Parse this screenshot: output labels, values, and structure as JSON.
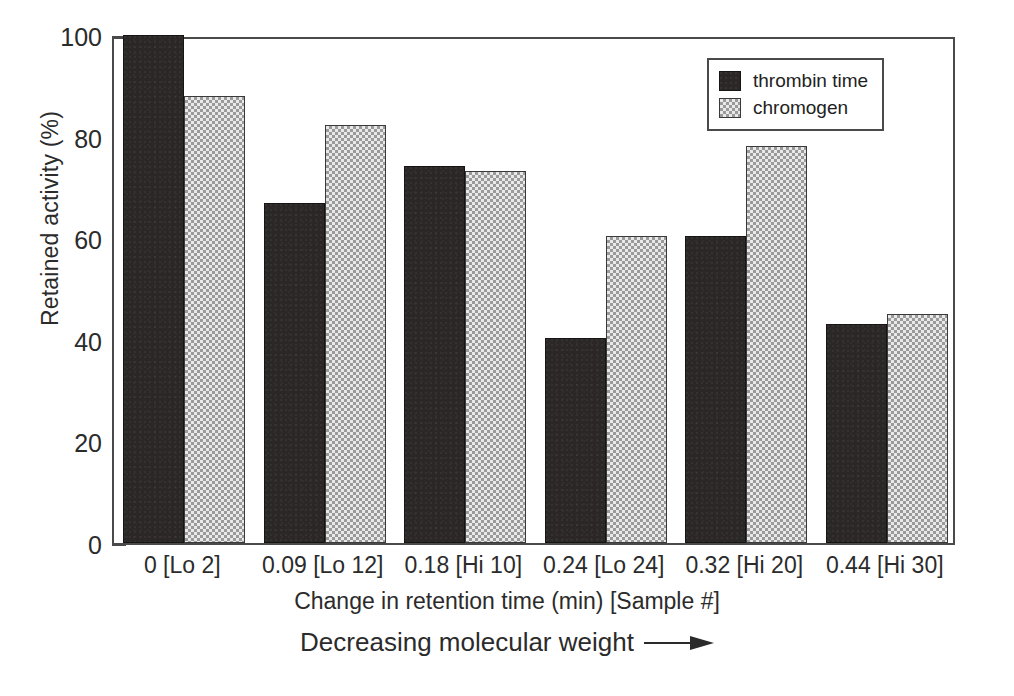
{
  "chart_data": {
    "type": "bar",
    "title": "",
    "xlabel": "Change in retention time (min) [Sample #]",
    "ylabel": "Retained activity (%)",
    "annotation": "Decreasing molecular weight",
    "annotation_arrow": "right-arrow",
    "categories": [
      "0 [Lo 2]",
      "0.09 [Lo 12]",
      "0.18 [Hi 10]",
      "0.24 [Lo 24]",
      "0.32 [Hi 20]",
      "0.44 [Hi 30]"
    ],
    "series": [
      {
        "name": "thrombin time",
        "color": "#2a2726",
        "pattern": "solid-dark",
        "values": [
          100,
          67,
          74.3,
          40.4,
          60.4,
          43.2
        ]
      },
      {
        "name": "chromogen",
        "color": "#c9c9c9",
        "pattern": "checkered-light",
        "values": [
          88,
          82.3,
          73.3,
          60.5,
          78.2,
          45.1
        ]
      }
    ],
    "ylim": [
      0,
      100
    ],
    "yticks": [
      0,
      20,
      40,
      60,
      80,
      100
    ],
    "ytick_labels": [
      "0",
      "20",
      "40",
      "60",
      "80",
      "100"
    ],
    "grid": false,
    "legend_position": "top-right"
  },
  "legend": {
    "items": [
      {
        "label": "thrombin time",
        "style": "dark"
      },
      {
        "label": "chromogen",
        "style": "light"
      }
    ]
  }
}
